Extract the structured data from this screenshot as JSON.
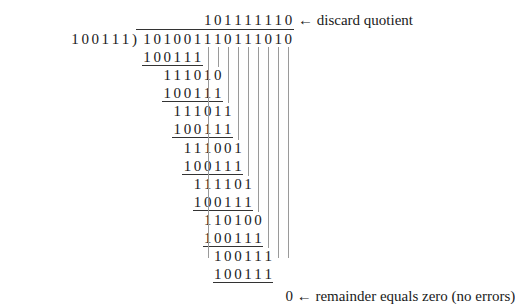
{
  "diagram": {
    "divisor": "100111",
    "dividend": "101001110111010",
    "quotient": "101111110",
    "quotient_note": "← discard quotient",
    "remainder": "0",
    "remainder_note": "← remainder equals zero (no errors)",
    "steps": [
      {
        "sub": "100111",
        "sub_start": 0,
        "result": "111010",
        "result_start": 2
      },
      {
        "sub": "100111",
        "sub_start": 2,
        "result": "111011",
        "result_start": 3
      },
      {
        "sub": "100111",
        "sub_start": 3,
        "result": "111001",
        "result_start": 4
      },
      {
        "sub": "100111",
        "sub_start": 4,
        "result": "111101",
        "result_start": 5
      },
      {
        "sub": "100111",
        "sub_start": 5,
        "result": "110100",
        "result_start": 6
      },
      {
        "sub": "100111",
        "sub_start": 6,
        "result": "100111",
        "result_start": 7
      },
      {
        "sub": "100111",
        "sub_start": 7,
        "result": "0",
        "result_start": 14
      }
    ]
  }
}
